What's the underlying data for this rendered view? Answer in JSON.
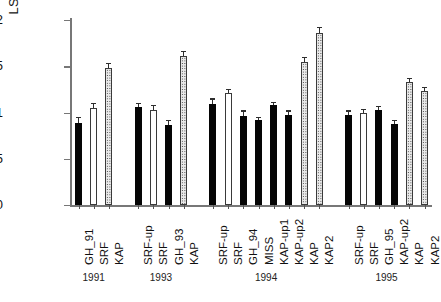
{
  "chart_data": {
    "type": "bar",
    "title": "",
    "xlabel": "",
    "ylabel": "LSI (%)",
    "ylim": [
      0,
      2
    ],
    "yticks": [
      "0",
      "0.5",
      "1",
      "1.5",
      "2"
    ],
    "grid": false,
    "legend": null,
    "group_label_name": "year",
    "groups": [
      {
        "label": "1991",
        "categories": [
          "GH_91",
          "SRF",
          "KAP"
        ]
      },
      {
        "label": "1993",
        "categories": [
          "SRF-up",
          "SRF",
          "GH_93",
          "KAP"
        ]
      },
      {
        "label": "1994",
        "categories": [
          "SRF-up",
          "SRF",
          "GH_94",
          "MISS",
          "KAP-up1",
          "KAP-up2",
          "KAP",
          "KAP2"
        ]
      },
      {
        "label": "1995",
        "categories": [
          "SRF-up",
          "SRF",
          "GH_95",
          "KAP-up2",
          "KAP",
          "KAP2"
        ]
      }
    ],
    "categories": [
      "GH_91",
      "SRF",
      "KAP",
      "SRF-up",
      "SRF",
      "GH_93",
      "KAP",
      "SRF-up",
      "SRF",
      "GH_94",
      "MISS",
      "KAP-up1",
      "KAP-up2",
      "KAP",
      "KAP2",
      "SRF-up",
      "SRF",
      "GH_95",
      "KAP-up2",
      "KAP",
      "KAP2"
    ],
    "values": [
      0.89,
      1.05,
      1.48,
      1.06,
      1.03,
      0.87,
      1.61,
      1.09,
      1.21,
      0.96,
      0.92,
      1.08,
      0.97,
      1.55,
      1.86,
      0.97,
      0.99,
      1.03,
      0.88,
      1.33,
      1.23
    ],
    "errors": [
      0.05,
      0.04,
      0.04,
      0.03,
      0.04,
      0.04,
      0.04,
      0.05,
      0.03,
      0.05,
      0.02,
      0.02,
      0.04,
      0.04,
      0.05,
      0.04,
      0.04,
      0.03,
      0.03,
      0.03,
      0.03
    ],
    "fills": [
      "solid",
      "hollow",
      "dotted",
      "solid",
      "hollow",
      "solid",
      "dotted",
      "solid",
      "hollow",
      "solid",
      "solid",
      "solid",
      "solid",
      "dotted",
      "dotted",
      "solid",
      "hollow",
      "solid",
      "solid",
      "dotted",
      "dotted"
    ],
    "fill_legend": {
      "solid": "solid-black-bar",
      "hollow": "white-open-bar",
      "dotted": "stippled-gray-bar"
    },
    "colors": {
      "solid": "#050505",
      "hollow": "#ffffff",
      "dotted": "#e9e9e9",
      "outline": "#3a3a3a",
      "axis": "#777777",
      "text": "#111111"
    }
  }
}
